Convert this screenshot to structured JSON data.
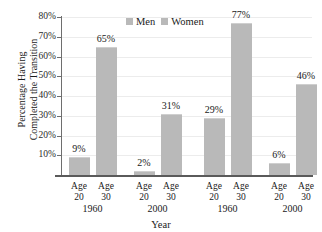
{
  "title_remnant": "",
  "chart_data": {
    "type": "bar",
    "title": "",
    "xlabel": "Year",
    "ylabel_line1": "Percentage Having",
    "ylabel_line2": "Completed the Transition",
    "ylim": [
      0,
      80
    ],
    "ytick_labels": [
      "80%",
      "70%",
      "60%",
      "50%",
      "40%",
      "30%",
      "20%",
      "10%"
    ],
    "ytick_values": [
      80,
      70,
      60,
      50,
      40,
      30,
      20,
      10
    ],
    "grid": true,
    "legend_position": "top-center",
    "legend": [
      "Men",
      "Women"
    ],
    "bar_color": "#b9b9b9",
    "panels": [
      {
        "series": "Men",
        "groups": [
          {
            "year": "1960",
            "bars": [
              {
                "age_word": "Age",
                "age_num": "20",
                "value": 9,
                "label": "9%"
              },
              {
                "age_word": "Age",
                "age_num": "30",
                "value": 65,
                "label": "65%"
              }
            ]
          },
          {
            "year": "2000",
            "bars": [
              {
                "age_word": "Age",
                "age_num": "20",
                "value": 2,
                "label": "2%"
              },
              {
                "age_word": "Age",
                "age_num": "30",
                "value": 31,
                "label": "31%"
              }
            ]
          }
        ]
      },
      {
        "series": "Women",
        "groups": [
          {
            "year": "1960",
            "bars": [
              {
                "age_word": "Age",
                "age_num": "20",
                "value": 29,
                "label": "29%"
              },
              {
                "age_word": "Age",
                "age_num": "30",
                "value": 77,
                "label": "77%"
              }
            ]
          },
          {
            "year": "2000",
            "bars": [
              {
                "age_word": "Age",
                "age_num": "20",
                "value": 6,
                "label": "6%"
              },
              {
                "age_word": "Age",
                "age_num": "30",
                "value": 46,
                "label": "46%"
              }
            ]
          }
        ]
      }
    ]
  }
}
